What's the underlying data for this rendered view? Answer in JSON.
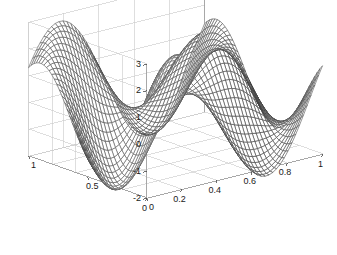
{
  "figure": {
    "title": "",
    "background_color": "#ffffff",
    "width": 337,
    "height": 255,
    "grid_color": "#c8c8c8",
    "axis_color": "#9a9a9a",
    "mesh_color": "#2b2b2b",
    "mesh_highlight_color": "#6e6e6e"
  },
  "chart_data": {
    "type": "surface",
    "plot_style": "mesh-wireframe-3d",
    "title": "",
    "xlabel": "",
    "ylabel": "",
    "zlabel": "",
    "xlim": [
      0,
      1
    ],
    "ylim": [
      0,
      1
    ],
    "zlim": [
      -2,
      3
    ],
    "grid": true,
    "legend": false,
    "view": {
      "azimuth": -37.5,
      "elevation": 30
    },
    "x_ticks": [
      {
        "value": 0,
        "label": "0"
      },
      {
        "value": 0.2,
        "label": "0.2"
      },
      {
        "value": 0.4,
        "label": "0.4"
      },
      {
        "value": 0.6,
        "label": "0.6"
      },
      {
        "value": 0.8,
        "label": "0.8"
      },
      {
        "value": 1,
        "label": "1"
      }
    ],
    "y_ticks": [
      {
        "value": 0,
        "label": "0"
      },
      {
        "value": 0.5,
        "label": "0.5"
      },
      {
        "value": 1,
        "label": "1"
      }
    ],
    "z_ticks": [
      {
        "value": -2,
        "label": "-2"
      },
      {
        "value": -1,
        "label": "-1"
      },
      {
        "value": 0,
        "label": "0"
      },
      {
        "value": 1,
        "label": "1"
      },
      {
        "value": 2,
        "label": "2"
      },
      {
        "value": 3,
        "label": "3"
      }
    ],
    "surface": {
      "description": "Smooth oscillatory saddle-like surface with two ridge crests and two troughs; peak near z=2.4 at back-center, valley near z=-1.9 at front-left-center.",
      "grid_n": 46,
      "z_observed_range": [
        -1.9,
        2.4
      ],
      "function": "peaks-like: 1.6*sin(2*pi*x + 0.35)*cos(2*pi*y) + 1.0*sin(2*pi*(x-y)) - 0.45*cos(4*pi*x)*sin(2*pi*y)"
    }
  },
  "axis_labels": {
    "z": [
      "3",
      "2",
      "1",
      "0",
      "-1",
      "-2"
    ],
    "y": [
      "1",
      "0.5",
      "0"
    ],
    "x": [
      "0",
      "0.2",
      "0.4",
      "0.6",
      "0.8",
      "1"
    ]
  }
}
